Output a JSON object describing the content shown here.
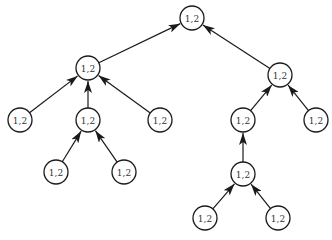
{
  "diagram": {
    "type": "tree",
    "edge_direction": "child-to-parent",
    "nodes": [
      {
        "id": "n0",
        "label": "1,2",
        "parent": null
      },
      {
        "id": "n1",
        "label": "1,2",
        "parent": "n0"
      },
      {
        "id": "n2",
        "label": "1,2",
        "parent": "n0"
      },
      {
        "id": "n3",
        "label": "1,2",
        "parent": "n1"
      },
      {
        "id": "n4",
        "label": "1,2",
        "parent": "n1"
      },
      {
        "id": "n5",
        "label": "1,2",
        "parent": "n1"
      },
      {
        "id": "n6",
        "label": "1,2",
        "parent": "n4"
      },
      {
        "id": "n7",
        "label": "1,2",
        "parent": "n4"
      },
      {
        "id": "n8",
        "label": "1,2",
        "parent": "n2"
      },
      {
        "id": "n9",
        "label": "1,2",
        "parent": "n2"
      },
      {
        "id": "n10",
        "label": "1,2",
        "parent": "n8"
      },
      {
        "id": "n11",
        "label": "1,2",
        "parent": "n10"
      },
      {
        "id": "n12",
        "label": "1,2",
        "parent": "n10"
      }
    ],
    "colors": {
      "stroke": "#1a1a1a",
      "text": "#333333",
      "background": "#ffffff"
    }
  }
}
